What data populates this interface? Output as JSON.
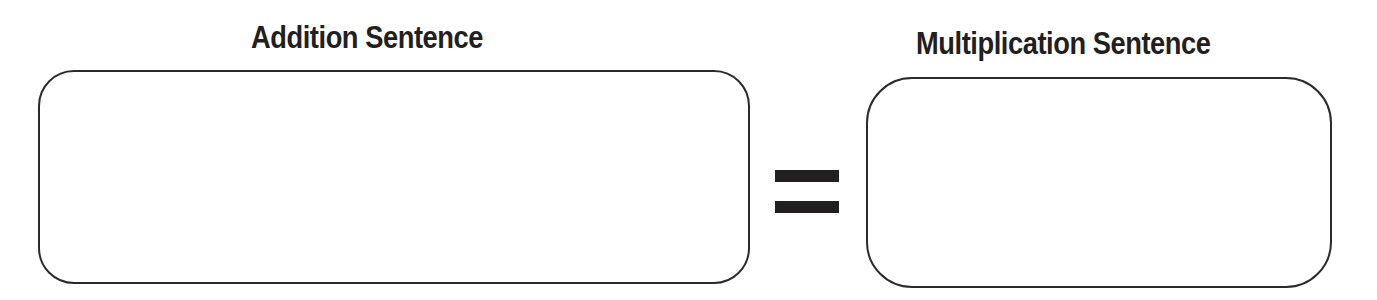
{
  "worksheet": {
    "left_panel": {
      "heading": "Addition Sentence",
      "answer_value": ""
    },
    "operator": {
      "symbol": "=",
      "icon": "equals-sign-icon"
    },
    "right_panel": {
      "heading": "Multiplication Sentence",
      "answer_value": ""
    },
    "colors": {
      "text": "#231f20",
      "border": "#2b2b2b",
      "background": "#ffffff"
    }
  }
}
